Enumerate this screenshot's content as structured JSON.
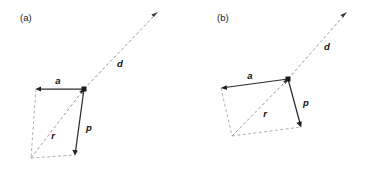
{
  "figure": {
    "background_color": "#ffffff",
    "solid_vector_color": "#2b2b2b",
    "dashed_vector_color": "#8c8c8c",
    "label_color": "#111111",
    "panels": [
      {
        "id": "panel-a",
        "label": "(a)",
        "label_position": {
          "x": 20,
          "y": 21
        },
        "vectors": [
          {
            "name": "a",
            "label": "a",
            "style": "solid",
            "label_position": {
              "x": 58,
              "y": 84
            },
            "from": {
              "x": 84,
              "y": 89
            },
            "to": {
              "x": 36,
              "y": 89
            }
          },
          {
            "name": "p",
            "label": "p",
            "style": "solid",
            "label_position": {
              "x": 89,
              "y": 131
            },
            "from": {
              "x": 84,
              "y": 89
            },
            "to": {
              "x": 75,
              "y": 155
            }
          },
          {
            "name": "r",
            "label": "r",
            "style": "dashed",
            "label_position": {
              "x": 53,
              "y": 139
            },
            "from": {
              "x": 31,
              "y": 158
            },
            "to": {
              "x": 84,
              "y": 89
            }
          },
          {
            "name": "d",
            "label": "d",
            "style": "dashed",
            "label_position": {
              "x": 120,
              "y": 67
            },
            "from": {
              "x": 84,
              "y": 89
            },
            "to": {
              "x": 158,
              "y": 12
            }
          }
        ],
        "parallelogram": {
          "corner_common": {
            "x": 84,
            "y": 89
          },
          "corner_a_tip": {
            "x": 36,
            "y": 89
          },
          "corner_origin": {
            "x": 31,
            "y": 158
          },
          "corner_p_tip": {
            "x": 75,
            "y": 155
          }
        }
      },
      {
        "id": "panel-b",
        "label": "(b)",
        "label_position": {
          "x": 217,
          "y": 21
        },
        "vectors": [
          {
            "name": "a",
            "label": "a",
            "style": "solid",
            "label_position": {
              "x": 250,
              "y": 79
            },
            "from": {
              "x": 288,
              "y": 79
            },
            "to": {
              "x": 221,
              "y": 88
            }
          },
          {
            "name": "p",
            "label": "p",
            "style": "solid",
            "label_position": {
              "x": 306,
              "y": 106
            },
            "from": {
              "x": 288,
              "y": 79
            },
            "to": {
              "x": 301,
              "y": 127
            }
          },
          {
            "name": "r",
            "label": "r",
            "style": "dashed",
            "label_position": {
              "x": 265,
              "y": 117
            },
            "from": {
              "x": 232,
              "y": 136
            },
            "to": {
              "x": 288,
              "y": 79
            }
          },
          {
            "name": "d",
            "label": "d",
            "style": "dashed",
            "label_position": {
              "x": 327,
              "y": 50
            },
            "from": {
              "x": 288,
              "y": 79
            },
            "to": {
              "x": 347,
              "y": 12
            }
          }
        ],
        "parallelogram": {
          "corner_common": {
            "x": 288,
            "y": 79
          },
          "corner_a_tip": {
            "x": 221,
            "y": 88
          },
          "corner_origin": {
            "x": 232,
            "y": 136
          },
          "corner_p_tip": {
            "x": 301,
            "y": 127
          }
        }
      }
    ]
  }
}
